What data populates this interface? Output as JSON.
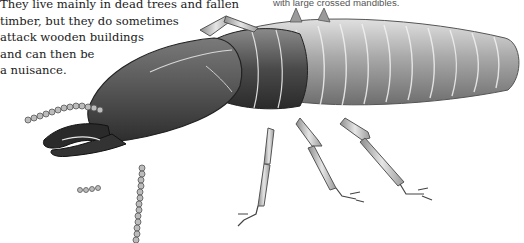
{
  "caption_left": {
    "lines": [
      "They live mainly in dead trees and fallen",
      "timber, but they do sometimes",
      "attack wooden buildings",
      "and can then be",
      "a nuisance."
    ]
  },
  "caption_right": {
    "text": "with large crossed mandibles."
  },
  "illustration": {
    "subject": "termite-soldier",
    "colors": {
      "head_dark": "#3a3a3a",
      "head_mid": "#6b6b6b",
      "abdomen": "#9a9a9a",
      "abdomen_light": "#c4c4c4",
      "legs": "#bdbdbd",
      "outline": "#222222"
    }
  }
}
